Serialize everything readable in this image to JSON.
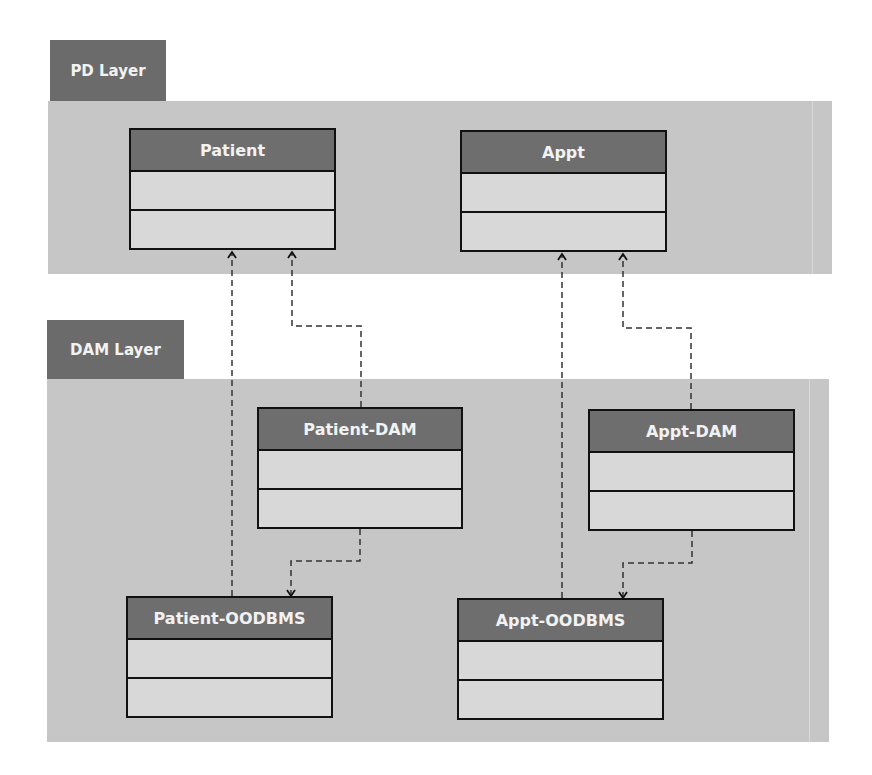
{
  "layers": {
    "pd": {
      "label": "PD Layer"
    },
    "dam": {
      "label": "DAM Layer"
    }
  },
  "classes": {
    "patient": {
      "name": "Patient"
    },
    "appt": {
      "name": "Appt"
    },
    "patient_dam": {
      "name": "Patient-DAM"
    },
    "appt_dam": {
      "name": "Appt-DAM"
    },
    "patient_oodbms": {
      "name": "Patient-OODBMS"
    },
    "appt_oodbms": {
      "name": "Appt-OODBMS"
    }
  },
  "dependencies": [
    {
      "from": "Patient-DAM",
      "to": "Patient",
      "style": "dashed"
    },
    {
      "from": "Patient-OODBMS",
      "to": "Patient",
      "style": "dashed"
    },
    {
      "from": "Patient-DAM",
      "to": "Patient-OODBMS",
      "style": "dashed"
    },
    {
      "from": "Appt-DAM",
      "to": "Appt",
      "style": "dashed"
    },
    {
      "from": "Appt-OODBMS",
      "to": "Appt",
      "style": "dashed"
    },
    {
      "from": "Appt-DAM",
      "to": "Appt-OODBMS",
      "style": "dashed"
    }
  ],
  "colors": {
    "tab": "#6b6b6b",
    "panel": "#c6c6c6",
    "class_header": "#6e6e6e",
    "class_body": "#d8d8d8",
    "border": "#111111"
  }
}
